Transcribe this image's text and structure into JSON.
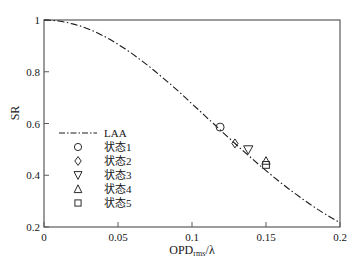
{
  "chart_data": {
    "type": "line",
    "title": "",
    "xlabel": "OPD_rms/λ",
    "xlabel_base": "OPD",
    "xlabel_sub": "rms",
    "xlabel_tail": "/λ",
    "ylabel": "SR",
    "xlim": [
      0,
      0.2
    ],
    "ylim": [
      0.2,
      1
    ],
    "xticks": [
      0,
      0.05,
      0.1,
      0.15,
      0.2
    ],
    "xtick_labels": [
      "0",
      "0.05",
      "0.1",
      "0.15",
      "0.2"
    ],
    "yticks": [
      0.2,
      0.4,
      0.6,
      0.8,
      1
    ],
    "ytick_labels": [
      "0.2",
      "0.4",
      "0.6",
      "0.8",
      "1"
    ],
    "grid": false,
    "legend_position": "center-left",
    "series": [
      {
        "name": "LAA",
        "marker": "none",
        "linestyle": "dashdot",
        "color": "#1a1a1a",
        "x": [
          0,
          0.005,
          0.01,
          0.015,
          0.02,
          0.025,
          0.03,
          0.035,
          0.04,
          0.045,
          0.05,
          0.055,
          0.06,
          0.065,
          0.07,
          0.075,
          0.08,
          0.085,
          0.09,
          0.095,
          0.1,
          0.105,
          0.11,
          0.115,
          0.12,
          0.125,
          0.13,
          0.135,
          0.14,
          0.145,
          0.15,
          0.155,
          0.16,
          0.165,
          0.17,
          0.175,
          0.18,
          0.185,
          0.19,
          0.195,
          0.2
        ],
        "y": [
          1.0,
          0.999,
          0.996,
          0.991,
          0.984,
          0.976,
          0.965,
          0.953,
          0.939,
          0.924,
          0.906,
          0.888,
          0.868,
          0.847,
          0.825,
          0.802,
          0.778,
          0.754,
          0.729,
          0.703,
          0.676,
          0.65,
          0.623,
          0.597,
          0.57,
          0.544,
          0.518,
          0.492,
          0.467,
          0.442,
          0.418,
          0.394,
          0.371,
          0.349,
          0.328,
          0.307,
          0.287,
          0.268,
          0.25,
          0.233,
          0.216
        ]
      },
      {
        "name": "状态1",
        "marker": "circle",
        "linestyle": "none",
        "color": "#1a1a1a",
        "x": [
          0.119
        ],
        "y": [
          0.586
        ]
      },
      {
        "name": "状态2",
        "marker": "diamond",
        "linestyle": "none",
        "color": "#1a1a1a",
        "x": [
          0.129
        ],
        "y": [
          0.523
        ]
      },
      {
        "name": "状态3",
        "marker": "triangle-down",
        "linestyle": "none",
        "color": "#1a1a1a",
        "x": [
          0.138
        ],
        "y": [
          0.5
        ]
      },
      {
        "name": "状态4",
        "marker": "triangle-up",
        "linestyle": "none",
        "color": "#1a1a1a",
        "x": [
          0.15
        ],
        "y": [
          0.455
        ]
      },
      {
        "name": "状态5",
        "marker": "square",
        "linestyle": "none",
        "color": "#1a1a1a",
        "x": [
          0.15
        ],
        "y": [
          0.44
        ]
      }
    ],
    "legend_entries": [
      {
        "label": "LAA",
        "marker": "line-dashdot"
      },
      {
        "label": "状态1",
        "marker": "circle"
      },
      {
        "label": "状态2",
        "marker": "diamond"
      },
      {
        "label": "状态3",
        "marker": "triangle-down"
      },
      {
        "label": "状态4",
        "marker": "triangle-up"
      },
      {
        "label": "状态5",
        "marker": "square"
      }
    ]
  },
  "colors": {
    "axis": "#5a5a5a",
    "curve": "#1a1a1a",
    "marker": "#2a2a2a",
    "background": "#ffffff"
  }
}
